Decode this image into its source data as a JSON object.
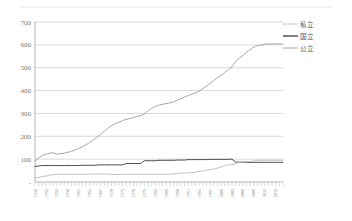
{
  "chart_data": {
    "type": "line",
    "title": "",
    "subtitle": "",
    "xlabel": "",
    "ylabel": "",
    "grid": true,
    "legend_position": "top-right",
    "ylim": [
      0,
      700
    ],
    "yticks": [
      0,
      100,
      200,
      300,
      400,
      500,
      600,
      700
    ],
    "ytick_labels": [
      "-",
      "100",
      "200",
      "300",
      "400",
      "500",
      "600",
      "700"
    ],
    "xlim": [
      1949,
      2017
    ],
    "xtick_labels": [
      "1949",
      "1952",
      "1955",
      "1958",
      "1961",
      "1964",
      "1967",
      "1970",
      "1973",
      "1976",
      "1979",
      "1982",
      "1985",
      "1988",
      "1991",
      "1994",
      "1997",
      "2000",
      "2003",
      "2006",
      "2009",
      "2012",
      "2015"
    ],
    "x": [
      1949,
      1950,
      1951,
      1952,
      1953,
      1954,
      1955,
      1956,
      1957,
      1958,
      1959,
      1960,
      1961,
      1962,
      1963,
      1964,
      1965,
      1966,
      1967,
      1968,
      1969,
      1970,
      1971,
      1972,
      1973,
      1974,
      1975,
      1976,
      1977,
      1978,
      1979,
      1980,
      1981,
      1982,
      1983,
      1984,
      1985,
      1986,
      1987,
      1988,
      1989,
      1990,
      1991,
      1992,
      1993,
      1994,
      1995,
      1996,
      1997,
      1998,
      1999,
      2000,
      2001,
      2002,
      2003,
      2004,
      2005,
      2006,
      2007,
      2008,
      2009,
      2010,
      2011,
      2012,
      2013,
      2014,
      2015,
      2016,
      2017
    ],
    "series": [
      {
        "name": "私立",
        "style": "dotted",
        "color": "#8a8a8a",
        "values": [
          92,
          105,
          116,
          122,
          126,
          128,
          122,
          124,
          126,
          130,
          134,
          140,
          147,
          154,
          163,
          173,
          184,
          196,
          208,
          222,
          235,
          247,
          255,
          261,
          269,
          274,
          278,
          282,
          287,
          290,
          297,
          311,
          322,
          331,
          337,
          340,
          343,
          346,
          350,
          358,
          364,
          372,
          378,
          384,
          390,
          398,
          409,
          419,
          431,
          444,
          457,
          466,
          478,
          491,
          504,
          526,
          542,
          553,
          568,
          579,
          590,
          597,
          599,
          603,
          604,
          604,
          604,
          604,
          604
        ]
      },
      {
        "name": "国立",
        "style": "solid",
        "color": "#4a4a4a",
        "values": [
          68,
          70,
          72,
          72,
          72,
          72,
          72,
          72,
          72,
          72,
          72,
          72,
          72,
          73,
          73,
          73,
          73,
          74,
          75,
          75,
          75,
          75,
          75,
          75,
          75,
          81,
          81,
          81,
          81,
          81,
          93,
          93,
          93,
          93,
          95,
          95,
          95,
          95,
          95,
          96,
          96,
          96,
          98,
          98,
          98,
          98,
          98,
          98,
          99,
          99,
          99,
          99,
          99,
          99,
          100,
          87,
          87,
          87,
          86,
          86,
          86,
          86,
          86,
          86,
          86,
          86,
          86,
          86,
          86
        ]
      },
      {
        "name": "公立",
        "style": "solid",
        "color": "#c2c2c2",
        "values": [
          18,
          20,
          24,
          26,
          30,
          32,
          34,
          34,
          34,
          34,
          34,
          34,
          34,
          34,
          34,
          34,
          35,
          35,
          35,
          35,
          35,
          33,
          33,
          33,
          33,
          34,
          34,
          34,
          34,
          34,
          34,
          34,
          34,
          34,
          34,
          34,
          34,
          34,
          36,
          37,
          39,
          39,
          40,
          41,
          43,
          46,
          48,
          52,
          54,
          57,
          60,
          66,
          72,
          75,
          76,
          80,
          86,
          89,
          89,
          90,
          92,
          95,
          95,
          95,
          95,
          95,
          95,
          95,
          95
        ]
      }
    ]
  },
  "legend": {
    "items": [
      {
        "label": "私立"
      },
      {
        "label": "国立"
      },
      {
        "label": "公立"
      }
    ]
  }
}
